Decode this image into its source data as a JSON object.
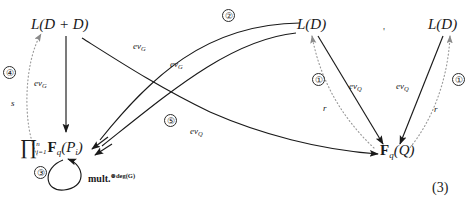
{
  "figure": {
    "equation_number": "(3)",
    "separator_mark": "'"
  },
  "nodes": [
    {
      "id": "l-d-plus-d",
      "label": "L(D + D)"
    },
    {
      "id": "l-d-middle",
      "label": "L(D)"
    },
    {
      "id": "l-d-right",
      "label": "L(D)"
    },
    {
      "id": "product-fq-pi",
      "prod": "∏",
      "upper": "n",
      "lower": "i=1",
      "body_bold": "F",
      "body_sub": "q",
      "body_arg": "(P",
      "body_arg_sub": "i",
      "body_close": ")"
    },
    {
      "id": "fq-q",
      "bold": "F",
      "sub": "q",
      "arg": "(Q)"
    }
  ],
  "edge_labels": [
    {
      "id": "ev-g-vertical",
      "base": "ev",
      "sub": "G"
    },
    {
      "id": "ev-g-upper-curve",
      "base": "ev",
      "sub": "G"
    },
    {
      "id": "ev-g-lower-curve",
      "base": "ev",
      "sub": "G"
    },
    {
      "id": "ev-q-long-curve",
      "base": "ev",
      "sub": "Q"
    },
    {
      "id": "ev-q-middle-left",
      "base": "ev",
      "sub": "Q"
    },
    {
      "id": "ev-q-middle-right",
      "base": "ev",
      "sub": "Q"
    },
    {
      "id": "s-label",
      "base": "s",
      "sub": ""
    },
    {
      "id": "r-label-left",
      "base": "r",
      "sub": ""
    },
    {
      "id": "r-label-right",
      "base": "r",
      "sub": ""
    }
  ],
  "circled_numbers": [
    {
      "id": "circle-4",
      "value": "④"
    },
    {
      "id": "circle-2",
      "value": "②"
    },
    {
      "id": "circle-5",
      "value": "⑤"
    },
    {
      "id": "circle-3",
      "value": "③"
    },
    {
      "id": "circle-1-left",
      "value": "①"
    },
    {
      "id": "circle-1-right",
      "value": "①"
    }
  ],
  "self_loop": {
    "id": "mult-loop",
    "label_main": "mult.",
    "label_sup": "⊗deg(G)"
  }
}
